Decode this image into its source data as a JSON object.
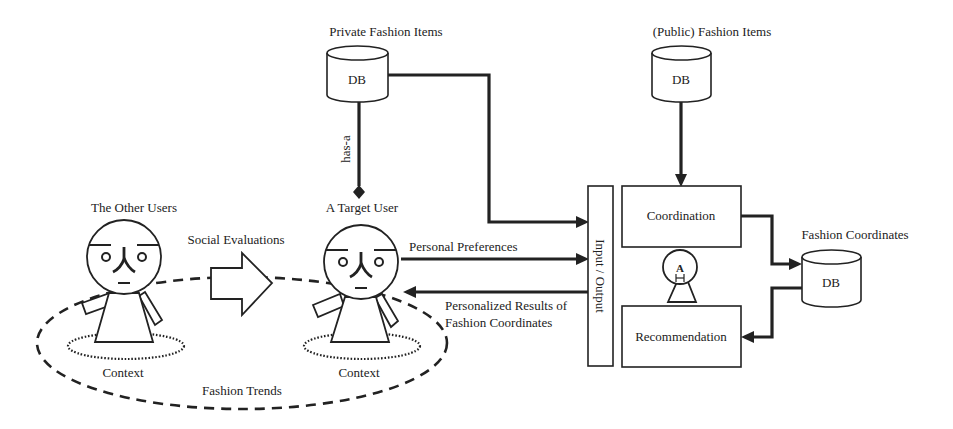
{
  "diagram": {
    "databases": {
      "private": {
        "title": "Private Fashion Items",
        "label": "DB"
      },
      "public": {
        "title": "(Public) Fashion Items",
        "label": "DB"
      },
      "coordinates": {
        "title": "Fashion Coordinates",
        "label": "DB"
      }
    },
    "users": {
      "other": {
        "title": "The Other Users",
        "context": "Context"
      },
      "target": {
        "title": "A Target User",
        "context": "Context"
      }
    },
    "relations": {
      "has_a": "has-a",
      "social_evaluations": "Social Evaluations",
      "personal_preferences": "Personal Preferences",
      "results_line1": "Personalized Results of",
      "results_line2": "Fashion Coordinates",
      "fashion_trends": "Fashion Trends"
    },
    "system": {
      "io": "Input / Output",
      "coordination": "Coordination",
      "recommendation": "Recommendation",
      "agent_glyph": "A"
    },
    "colors": {
      "ink": "#222222",
      "background": "#ffffff"
    }
  }
}
